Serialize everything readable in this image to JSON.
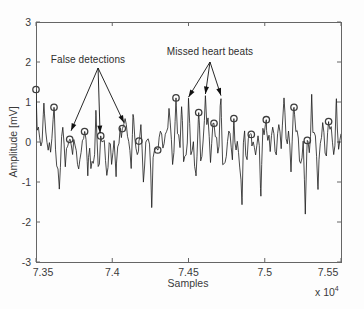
{
  "figure": {
    "kind": "matlab-style ECG detection plot",
    "colors": {
      "background": "#fdfdfd",
      "axis": "#666666",
      "trace": "#1c1c1c",
      "marker": "#3d3d3d",
      "arrow": "#111111",
      "text": "#3a3a3a"
    }
  },
  "chart_data": {
    "type": "line",
    "title": "",
    "xlabel": "Samples",
    "ylabel": "Amplitude [mV]",
    "x_multiplier": {
      "base": "x 10",
      "exp": "4"
    },
    "xlim": [
      73500,
      75500
    ],
    "ylim": [
      -3,
      3
    ],
    "grid": false,
    "box": true,
    "xticks": [
      {
        "value": 73500,
        "label": "7.35"
      },
      {
        "value": 74000,
        "label": "7.4"
      },
      {
        "value": 74500,
        "label": "7.45"
      },
      {
        "value": 75000,
        "label": "7.5"
      },
      {
        "value": 75500,
        "label": "7.55"
      }
    ],
    "yticks": [
      {
        "value": -3,
        "label": "-3"
      },
      {
        "value": -2,
        "label": "-2"
      },
      {
        "value": -1,
        "label": "-1"
      },
      {
        "value": 0,
        "label": "0"
      },
      {
        "value": 1,
        "label": "1"
      },
      {
        "value": 2,
        "label": "2"
      },
      {
        "value": 3,
        "label": "3"
      }
    ],
    "annotations": [
      {
        "text": "False detections",
        "text_pos": [
          73841,
          2.08
        ],
        "apex": [
          73907,
          1.85
        ],
        "targets": [
          [
            73730,
            0.28
          ],
          [
            73920,
            0.22
          ],
          [
            74077,
            0.48
          ]
        ]
      },
      {
        "text": "Missed heart beats",
        "text_pos": [
          74641,
          2.28
        ],
        "apex": [
          74641,
          2.0
        ],
        "targets": [
          [
            74500,
            1.12
          ],
          [
            74611,
            1.2
          ],
          [
            74713,
            1.16
          ]
        ]
      }
    ],
    "detections": [
      {
        "sample": 73500,
        "mv": 1.4
      },
      {
        "sample": 73618,
        "mv": 0.8
      },
      {
        "sample": 73721,
        "mv": 0.07
      },
      {
        "sample": 73819,
        "mv": 0.26
      },
      {
        "sample": 73924,
        "mv": 0.13
      },
      {
        "sample": 74066,
        "mv": 0.38
      },
      {
        "sample": 74175,
        "mv": 0.09
      },
      {
        "sample": 74298,
        "mv": -0.09
      },
      {
        "sample": 74418,
        "mv": 1.03
      },
      {
        "sample": 74567,
        "mv": 0.7
      },
      {
        "sample": 74667,
        "mv": 0.41
      },
      {
        "sample": 74798,
        "mv": 0.58
      },
      {
        "sample": 74912,
        "mv": 0.19
      },
      {
        "sample": 75010,
        "mv": 0.57
      },
      {
        "sample": 75192,
        "mv": 0.8
      },
      {
        "sample": 75279,
        "mv": -0.02
      },
      {
        "sample": 75419,
        "mv": 0.44
      }
    ],
    "false_detection_indices": [
      2,
      4,
      5
    ],
    "missed_beats": [
      {
        "sample": 74500,
        "mv": 1.05
      },
      {
        "sample": 74611,
        "mv": 1.12
      },
      {
        "sample": 74713,
        "mv": 1.08
      }
    ],
    "extra_peaks": [
      {
        "sample": 73552,
        "mv": 0.95
      },
      {
        "sample": 73893,
        "mv": 0.85
      },
      {
        "sample": 74136,
        "mv": 0.7
      },
      {
        "sample": 74372,
        "mv": 0.85
      },
      {
        "sample": 74455,
        "mv": 0.8
      },
      {
        "sample": 75126,
        "mv": 1.1
      },
      {
        "sample": 75308,
        "mv": 1.3
      },
      {
        "sample": 75470,
        "mv": 1.05
      }
    ],
    "negative_spikes": [
      {
        "sample": 73653,
        "mv": -1.15
      },
      {
        "sample": 73840,
        "mv": -0.95
      },
      {
        "sample": 74025,
        "mv": -0.9
      },
      {
        "sample": 74259,
        "mv": -1.65
      },
      {
        "sample": 74549,
        "mv": -0.85
      },
      {
        "sample": 74851,
        "mv": -1.5
      },
      {
        "sample": 74975,
        "mv": -1.35
      },
      {
        "sample": 75266,
        "mv": -1.85
      },
      {
        "sample": 75349,
        "mv": -1.15
      }
    ],
    "noise": {
      "seed": 1337,
      "step": 8,
      "base_amplitude": 0.75,
      "negative_skew": 1.25,
      "spike_default_width": 12,
      "detection_spike_width": 10
    }
  }
}
